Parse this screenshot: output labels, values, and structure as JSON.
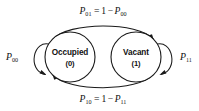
{
  "diagram": {
    "type": "state-transition-diagram",
    "stroke_color": "#1a1a1a",
    "background_color": "#ffffff",
    "nodes": [
      {
        "id": "occupied",
        "label": "Occupied",
        "state_index": "(0)",
        "cx": 70,
        "cy": 57,
        "r": 25
      },
      {
        "id": "vacant",
        "label": "Vacant",
        "state_index": "(1)",
        "cx": 136,
        "cy": 57,
        "r": 25
      }
    ],
    "self_loops": [
      {
        "id": "loop-00",
        "from": "occupied",
        "to": "occupied",
        "label_base": "P",
        "label_subscript": "00",
        "side": "left"
      },
      {
        "id": "loop-11",
        "from": "vacant",
        "to": "vacant",
        "label_base": "P",
        "label_subscript": "11",
        "side": "right"
      }
    ],
    "transitions": [
      {
        "id": "edge-01",
        "from": "occupied",
        "to": "vacant",
        "position": "top",
        "lhs_base": "P",
        "lhs_subscript": "01",
        "operator": "=",
        "rhs_number": "1",
        "rhs_minus": "−",
        "rhs_base": "P",
        "rhs_subscript": "00",
        "full_label": "P01 = 1 − P00"
      },
      {
        "id": "edge-10",
        "from": "vacant",
        "to": "occupied",
        "position": "bottom",
        "lhs_base": "P",
        "lhs_subscript": "10",
        "operator": "=",
        "rhs_number": "1",
        "rhs_minus": "−",
        "rhs_base": "P",
        "rhs_subscript": "11",
        "full_label": "P10 = 1 − P11"
      }
    ]
  }
}
